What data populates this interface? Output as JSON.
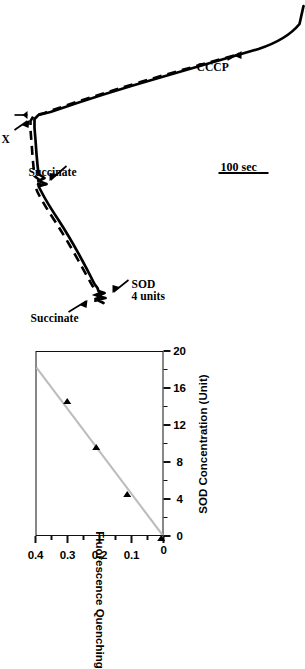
{
  "figure": {
    "kind": "fluorescence-trace-with-calibration-inset",
    "orientation_note": "printed sideways (rotated 90 degrees counter-clockwise)",
    "line_color": "#000000",
    "background": "#ffffff"
  },
  "trace": {
    "scale_bar_label": "100 sec",
    "annotations": [
      {
        "id": "succinate-1",
        "label": "Succinate"
      },
      {
        "id": "sod-4-units",
        "label": "SOD\n4 units"
      },
      {
        "id": "succinate-2",
        "label": "Succinate"
      },
      {
        "id": "xanthine",
        "label": "X"
      },
      {
        "id": "xanthine-oxidase",
        "label": "X/O"
      },
      {
        "id": "cccp",
        "label": "CCCP"
      }
    ],
    "annotation_labels": {
      "succinate_1": "Succinate",
      "sod_line1": "SOD",
      "sod_line2": "4 units",
      "succinate_2": "Succinate",
      "xanthine": "X",
      "xanthine_oxidase": "X/O",
      "cccp": "CCCP"
    },
    "series": [
      {
        "name": "solid-trace",
        "style": "solid"
      },
      {
        "name": "dashed-trace",
        "style": "dashed"
      }
    ]
  },
  "chart_data": {
    "type": "scatter",
    "title": "",
    "xlabel": "SOD Concentration (Unit)",
    "ylabel": "Fluorescence Quenching",
    "xlim": [
      0,
      20
    ],
    "ylim": [
      0,
      0.4
    ],
    "xticks": [
      0,
      4,
      8,
      12,
      16,
      20
    ],
    "xtick_labels": [
      "0",
      "4",
      "8",
      "12",
      "16",
      "20"
    ],
    "yticks": [
      0,
      0.1,
      0.2,
      0.3,
      0.4
    ],
    "ytick_labels": [
      "0",
      "0.1",
      "0.2",
      "0.3",
      "0.4"
    ],
    "x_minor_ticks": [
      2,
      6,
      10,
      14,
      18
    ],
    "y_minor_ticks": [
      0.05,
      0.15,
      0.25,
      0.35
    ],
    "grid": false,
    "legend": false,
    "marker": "left-pointing-triangle",
    "marker_color": "#000000",
    "points": [
      {
        "x": 0.2,
        "y": 0.005
      },
      {
        "x": 5.0,
        "y": 0.112
      },
      {
        "x": 10.0,
        "y": 0.208
      },
      {
        "x": 15.0,
        "y": 0.3
      }
    ],
    "x": [
      0.2,
      5.0,
      10.0,
      15.0
    ],
    "values": [
      0.005,
      0.112,
      0.208,
      0.3
    ],
    "fit_line": {
      "style": "solid",
      "color": "#bdbdbd",
      "x_start": 0.0,
      "y_start": 0.0,
      "x_end": 18.3,
      "y_end": 0.4
    }
  }
}
